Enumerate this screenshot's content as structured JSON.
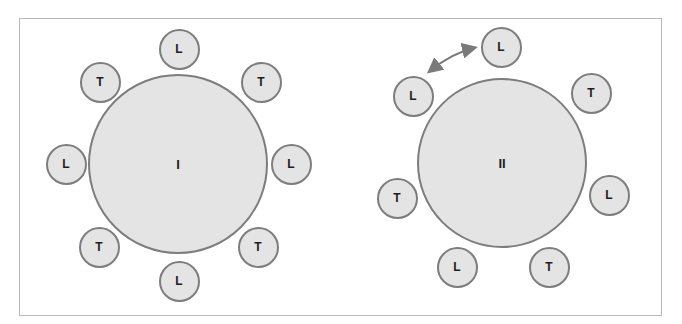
{
  "colors": {
    "fill": "#e4e4e4",
    "stroke": "#7d7d7d",
    "text": "#1e1e1e",
    "frame": "#b8b8b8",
    "arrow": "#7a7a7a"
  },
  "tables": [
    {
      "label": "I",
      "center": [
        178,
        164
      ],
      "diameter": 180,
      "seats": [
        {
          "label": "L",
          "cx": 179,
          "cy": 49
        },
        {
          "label": "T",
          "cx": 100,
          "cy": 82
        },
        {
          "label": "T",
          "cx": 261,
          "cy": 82
        },
        {
          "label": "L",
          "cx": 66,
          "cy": 164
        },
        {
          "label": "L",
          "cx": 291,
          "cy": 164
        },
        {
          "label": "T",
          "cx": 99,
          "cy": 247
        },
        {
          "label": "T",
          "cx": 258,
          "cy": 247
        },
        {
          "label": "L",
          "cx": 179,
          "cy": 281
        }
      ]
    },
    {
      "label": "II",
      "center": [
        502,
        163
      ],
      "diameter": 170,
      "seats": [
        {
          "label": "L",
          "cx": 501,
          "cy": 47
        },
        {
          "label": "L",
          "cx": 413,
          "cy": 96
        },
        {
          "label": "T",
          "cx": 591,
          "cy": 93
        },
        {
          "label": "T",
          "cx": 397,
          "cy": 198
        },
        {
          "label": "L",
          "cx": 609,
          "cy": 195
        },
        {
          "label": "L",
          "cx": 457,
          "cy": 267
        },
        {
          "label": "T",
          "cx": 549,
          "cy": 267
        }
      ]
    }
  ],
  "annotation": {
    "type": "double-headed-arrow",
    "from_seat": "table II seat L (upper-left)",
    "to_seat": "table II seat L (top)",
    "meaning": "swap"
  }
}
